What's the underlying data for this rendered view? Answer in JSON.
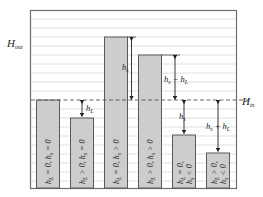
{
  "diagram": {
    "left_label": "H",
    "left_label_sub": "out",
    "right_label": "H",
    "right_label_sub": "in",
    "colors": {
      "frame": "#6e6e6e",
      "grid": "#d8d8d8",
      "bar_fill": "#cdcdcd",
      "bar_stroke": "#5a5a5a",
      "dashed_line": "#555555",
      "text": "#222222"
    },
    "bars": [
      {
        "condition": "h_L = 0, h_s = 0",
        "parts": [
          "h",
          "L",
          " = 0, ",
          "h",
          "s",
          " = 0"
        ],
        "annotation": ""
      },
      {
        "condition": "h_L > 0, h_s = 0",
        "parts": [
          "h",
          "L",
          " > 0, ",
          "h",
          "s",
          " = 0"
        ],
        "annotation": "h_L",
        "ann_main": "h",
        "ann_sub": "L"
      },
      {
        "condition": "h_L = 0, h_s > 0",
        "parts": [
          "h",
          "L",
          " = 0, ",
          "h",
          "s",
          " > 0"
        ],
        "annotation": "h_s",
        "ann_main": "h",
        "ann_sub": "s"
      },
      {
        "condition": "h_L > 0, h_s > 0",
        "parts": [
          "h",
          "L",
          " > 0, ",
          "h",
          "s",
          " > 0"
        ],
        "annotation": "h_s − h_L",
        "ann_main": "h",
        "ann_sub": "s",
        "ann_mid": " − ",
        "ann_main2": "h",
        "ann_sub2": "L"
      },
      {
        "condition": "h_L = 0, h_s < 0",
        "line1": [
          "h",
          "L",
          " = 0,"
        ],
        "line2": [
          "h",
          "s",
          " < 0"
        ],
        "annotation": "h_s",
        "ann_main": "h",
        "ann_sub": "s"
      },
      {
        "condition": "h_L > 0, h_s < 0",
        "line1": [
          "h",
          "L",
          " > 0,"
        ],
        "line2": [
          "h",
          "s",
          " < 0"
        ],
        "annotation": "h_s + h_L",
        "ann_main": "h",
        "ann_sub": "s",
        "ann_mid": " + ",
        "ann_main2": "h",
        "ann_sub2": "L"
      }
    ]
  }
}
